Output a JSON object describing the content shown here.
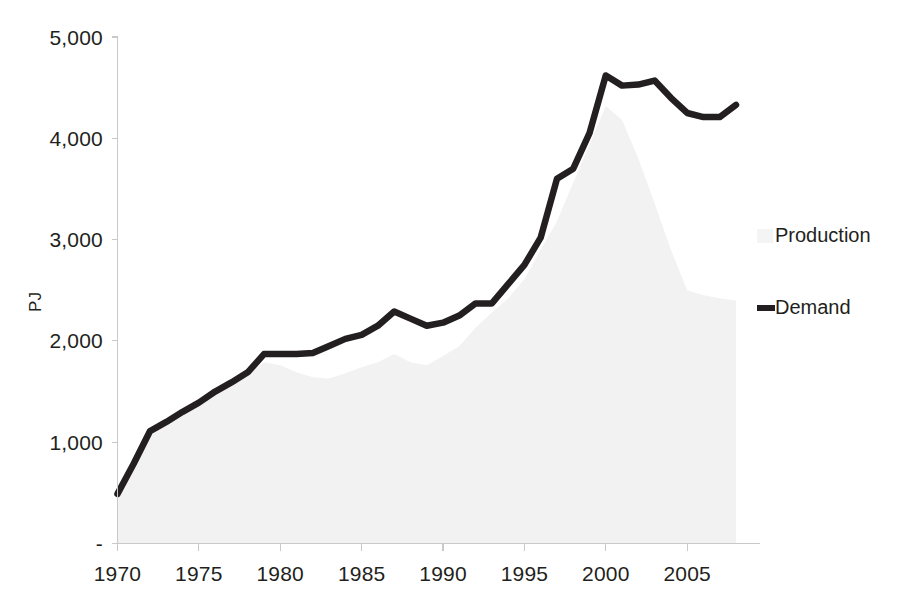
{
  "chart_data": {
    "type": "area",
    "title": "",
    "xlabel": "",
    "ylabel": "PJ",
    "xlim": [
      1970,
      2008
    ],
    "ylim": [
      0,
      5000
    ],
    "grid": false,
    "legend_position": "right",
    "x_ticks": [
      "1970",
      "1975",
      "1980",
      "1985",
      "1990",
      "1995",
      "2000",
      "2005"
    ],
    "x_tick_values": [
      1970,
      1975,
      1980,
      1985,
      1990,
      1995,
      2000,
      2005
    ],
    "y_ticks": [
      "-",
      "1,000",
      "2,000",
      "3,000",
      "4,000",
      "5,000"
    ],
    "y_tick_values": [
      0,
      1000,
      2000,
      3000,
      4000,
      5000
    ],
    "x": [
      1970,
      1971,
      1972,
      1973,
      1974,
      1975,
      1976,
      1977,
      1978,
      1979,
      1980,
      1981,
      1982,
      1983,
      1984,
      1985,
      1986,
      1987,
      1988,
      1989,
      1990,
      1991,
      1992,
      1993,
      1994,
      1995,
      1996,
      1997,
      1998,
      1999,
      2000,
      2001,
      2002,
      2003,
      2004,
      2005,
      2006,
      2007,
      2008
    ],
    "series": [
      {
        "name": "Production",
        "type": "area",
        "color": "#f2f2f2",
        "values": [
          470,
          780,
          1060,
          1190,
          1280,
          1370,
          1480,
          1570,
          1660,
          1790,
          1760,
          1690,
          1640,
          1630,
          1680,
          1740,
          1790,
          1870,
          1790,
          1760,
          1850,
          1950,
          2130,
          2280,
          2420,
          2610,
          2900,
          3180,
          3560,
          3940,
          4320,
          4180,
          3800,
          3360,
          2900,
          2500,
          2450,
          2420,
          2400
        ]
      },
      {
        "name": "Demand",
        "type": "line",
        "color": "#231f20",
        "values": [
          490,
          790,
          1110,
          1200,
          1300,
          1390,
          1500,
          1590,
          1690,
          1870,
          1870,
          1870,
          1880,
          1950,
          2020,
          2060,
          2150,
          2290,
          2220,
          2150,
          2180,
          2250,
          2370,
          2370,
          2560,
          2750,
          3020,
          3600,
          3700,
          4050,
          4620,
          4520,
          4530,
          4570,
          4400,
          4250,
          4210,
          4210,
          4330
        ]
      }
    ]
  },
  "legend": {
    "entries": [
      {
        "label": "Production",
        "swatch": "area",
        "color": "#f4f4f4"
      },
      {
        "label": "Demand",
        "swatch": "line",
        "color": "#231f20"
      }
    ]
  }
}
